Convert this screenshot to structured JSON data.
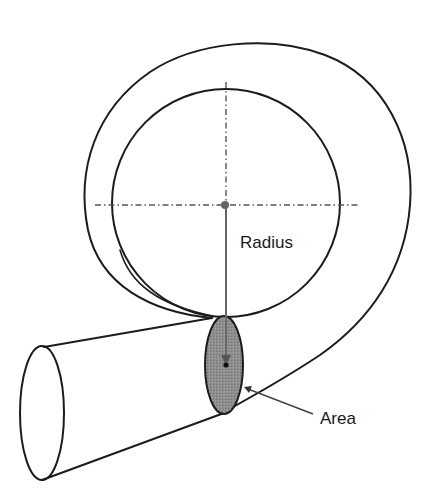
{
  "diagram": {
    "labels": {
      "radius": "Radius",
      "area": "Area"
    },
    "colors": {
      "line": "#1c1c1c",
      "centerline": "#555555",
      "area_fill": "#8a8a8a",
      "radius_line": "#666666",
      "background": "#ffffff"
    },
    "components": [
      "outer-volute-curve",
      "inner-impeller-circle",
      "vertical-centerline",
      "horizontal-centerline",
      "center-point",
      "radius-line",
      "cross-section-area-ellipse",
      "discharge-pipe",
      "discharge-outlet-ellipse",
      "area-leader-arrow"
    ]
  }
}
